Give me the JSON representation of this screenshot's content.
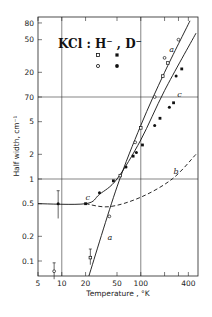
{
  "chart_data": {
    "type": "line",
    "xlabel": "Temperature , °K",
    "ylabel": "Half width, cm⁻¹",
    "xscale": "log",
    "yscale": "log",
    "xlim": [
      5,
      500
    ],
    "ylim": [
      0.065,
      95
    ],
    "grid": {
      "vertical": [
        10,
        100
      ],
      "horizontal": [
        1,
        10
      ]
    },
    "x_ticks": [
      5,
      10,
      20,
      50,
      100,
      200,
      300,
      400
    ],
    "x_tick_labels": [
      "5",
      "10",
      "20",
      "50",
      "100",
      "400"
    ],
    "y_ticks": [
      80,
      50,
      20,
      10,
      5,
      2,
      1,
      0.5,
      0.2,
      0.1
    ],
    "y_tick_labels": [
      "80",
      "50",
      "20",
      "70",
      "5",
      "2",
      "1",
      "0.5",
      "0.2",
      "0.1"
    ],
    "legend": {
      "title": "KCl : H⁻ , D⁻",
      "entries": [
        {
          "marker": "open-square",
          "column": "H⁻"
        },
        {
          "marker": "filled-square",
          "column": "D⁻"
        },
        {
          "marker": "open-circle",
          "column": "H⁻"
        },
        {
          "marker": "filled-circle",
          "column": "D⁻"
        }
      ]
    },
    "series": [
      {
        "name": "a",
        "style": "solid",
        "x": [
          22,
          50,
          100,
          200,
          420
        ],
        "y": [
          0.065,
          0.8,
          4.5,
          20,
          85
        ]
      },
      {
        "name": "c",
        "style": "solid",
        "x": [
          5,
          20,
          30,
          50,
          100,
          200,
          500
        ],
        "y": [
          0.5,
          0.5,
          0.65,
          1.0,
          3.0,
          12,
          60
        ]
      },
      {
        "name": "b",
        "style": "dashed",
        "x": [
          20,
          40,
          100,
          250,
          500
        ],
        "y": [
          0.5,
          0.46,
          0.6,
          1.0,
          2.0
        ]
      }
    ],
    "points_open": [
      {
        "x": 8,
        "y": 0.075,
        "err": [
          0.06,
          0.095
        ]
      },
      {
        "x": 23,
        "y": 0.11,
        "err": [
          0.09,
          0.14
        ]
      },
      {
        "x": 40,
        "y": 0.35
      },
      {
        "x": 55,
        "y": 1.1
      },
      {
        "x": 85,
        "y": 2.8
      },
      {
        "x": 100,
        "y": 4.2
      },
      {
        "x": 150,
        "y": 10
      },
      {
        "x": 190,
        "y": 18
      },
      {
        "x": 200,
        "y": 30
      },
      {
        "x": 220,
        "y": 26
      },
      {
        "x": 300,
        "y": 50
      }
    ],
    "points_filled": [
      {
        "x": 9,
        "y": 0.5,
        "err": [
          0.33,
          0.72
        ]
      },
      {
        "x": 20,
        "y": 0.5
      },
      {
        "x": 30,
        "y": 0.68
      },
      {
        "x": 45,
        "y": 0.95
      },
      {
        "x": 65,
        "y": 1.4
      },
      {
        "x": 80,
        "y": 1.9
      },
      {
        "x": 88,
        "y": 2.1
      },
      {
        "x": 105,
        "y": 2.6
      },
      {
        "x": 150,
        "y": 4.5
      },
      {
        "x": 175,
        "y": 5.5
      },
      {
        "x": 230,
        "y": 7.5
      },
      {
        "x": 260,
        "y": 8.5
      },
      {
        "x": 280,
        "y": 18
      },
      {
        "x": 330,
        "y": 22
      }
    ],
    "annotations": [
      {
        "text": "a",
        "x": 230,
        "y": 35
      },
      {
        "text": "c",
        "x": 290,
        "y": 10
      },
      {
        "text": "c",
        "x": 20,
        "y": 0.55
      },
      {
        "text": "b",
        "x": 260,
        "y": 1.15
      },
      {
        "text": "a",
        "x": 38,
        "y": 0.18
      }
    ]
  }
}
